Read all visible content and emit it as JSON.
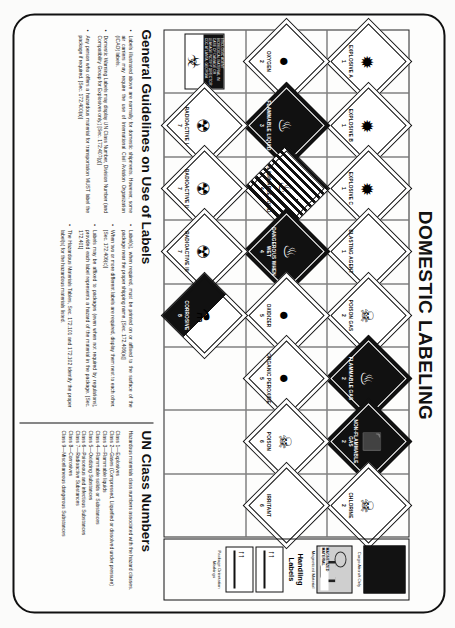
{
  "document": {
    "title": "DOMESTIC LABELING"
  },
  "label_grid": {
    "columns": [
      {
        "cells": [
          {
            "name": "EXPLOSIVE A",
            "symbol": "✹",
            "style": "empty",
            "number": "1"
          },
          {
            "name": "OXYGEN",
            "symbol": "●",
            "style": "empty",
            "number": "2"
          },
          {
            "name": "ETIOLOGIC AGENT",
            "style": "etiologic",
            "symbol": "☣",
            "caption": "ETIOLOGIC AGENT  BIOMEDICAL MATERIAL  IN CASE OF DAMAGE OR LEAKAGE NOTIFY DIRECTOR CDC ATLANTA, GEORGIA"
          }
        ]
      },
      {
        "cells": [
          {
            "name": "EXPLOSIVE B",
            "symbol": "✹",
            "style": "empty",
            "number": "1"
          },
          {
            "name": "FLAMMABLE LIQUID",
            "symbol": "♨",
            "style": "solid",
            "number": "3"
          },
          {
            "name": "RADIOACTIVE I",
            "symbol": "☢",
            "style": "empty",
            "number": "7"
          }
        ]
      },
      {
        "cells": [
          {
            "name": "EXPLOSIVE C",
            "symbol": "✹",
            "style": "empty",
            "number": "1"
          },
          {
            "name": "FLAMMABLE SOLID",
            "symbol": "♨",
            "style": "stripe",
            "number": "4"
          },
          {
            "name": "RADIOACTIVE II",
            "symbol": "☢",
            "style": "empty",
            "number": "7"
          }
        ]
      },
      {
        "cells": [
          {
            "name": "BLASTING AGENT",
            "symbol": "",
            "style": "empty",
            "number": "1"
          },
          {
            "name": "DANGEROUS WHEN WET",
            "symbol": "♨",
            "style": "solid",
            "number": "4"
          },
          {
            "name": "RADIOACTIVE III",
            "symbol": "☢",
            "style": "empty",
            "number": "7"
          }
        ]
      },
      {
        "cells": [
          {
            "name": "POISON GAS",
            "symbol": "☠",
            "style": "empty",
            "number": "2"
          },
          {
            "name": "OXIDIZER",
            "symbol": "●",
            "style": "empty",
            "number": "5"
          },
          {
            "name": "CORROSIVE",
            "symbol": "⚗",
            "style": "halfw",
            "number": "8"
          }
        ]
      },
      {
        "cells": [
          {
            "name": "FLAMMABLE GAS",
            "symbol": "♨",
            "style": "solid",
            "number": "2"
          },
          {
            "name": "ORGANIC PEROXIDE",
            "symbol": "●",
            "style": "empty",
            "number": "5"
          },
          {
            "name": "",
            "style": "blank",
            "symbol": "",
            "number": ""
          }
        ]
      },
      {
        "cells": [
          {
            "name": "NON-FLAMMABLE GAS",
            "symbol": "⬛",
            "style": "solid",
            "number": "2"
          },
          {
            "name": "POISON",
            "symbol": "☠",
            "style": "empty",
            "number": "6"
          },
          {
            "name": "",
            "style": "blank",
            "symbol": "",
            "number": ""
          }
        ]
      },
      {
        "cells": [
          {
            "name": "CHLORINE",
            "symbol": "☠",
            "style": "empty",
            "number": "2"
          },
          {
            "name": "IRRITANT",
            "symbol": "",
            "style": "empty",
            "number": "6"
          },
          {
            "name": "",
            "style": "blank",
            "symbol": "",
            "number": ""
          }
        ]
      }
    ]
  },
  "handling": {
    "title": "Handling Labels",
    "cargo_caption": "Cargo Aircraft Only",
    "magnetized_caption": "Magnetized Material",
    "magnetized_text": "MAGNETIZED MATERIAL",
    "orientation_caption": "Package Orientation Markings"
  },
  "guidelines": {
    "title": "General Guidelines on Use of Labels",
    "left_bullets": [
      "Labels illustrated above are normally for domestic shipments. However, some air carriers may require the use of International Civil Aviation Organization (ICAO) labels.",
      "Domestic Warning Labels may display UN Class Number, Division Number (and Compatibility Group for Explosives only.) [Sec. 172.407(g)]",
      "Any person who offers a hazardous material for transportation MUST label the package if required. [Sec. 172.400(a)]"
    ],
    "right_bullets": [
      "Label(s), when required, must be printed on or affixed to the surface of the package near the proper shipping name. [Sec. 172.406(a)]",
      "When two or more different labels are required, display them next to each other. [Sec. 172.406(c)]",
      "Labels may be affixed to packages (even when not required by regulations), provided each label represents a hazard of the material in the package. [Sec. 172.401]",
      "The Hazardous Materials Tables, Sec. 172.101 and 172.102 identify the proper label(s) for the hazardous materials listed."
    ]
  },
  "un_classes": {
    "title": "UN Class Numbers",
    "intro": "Hazardous materials class numbers associated with the hazard classes.",
    "items": [
      "Class 1—Explosives",
      "Class 2—Gases (Compressed, Liquefied or dissolved under pressure)",
      "Class 3—Flammable liquids",
      "Class 4—Flammable solids or Substances",
      "Class 5—Oxidizing Substances",
      "Class 6—Poisonous and infectious Substances",
      "Class 7—Radioactive Substances",
      "Class 8—Corrosives",
      "Class 9—Miscellaneous dangerous Substances"
    ],
    "class2_cont": "solved under pressure)"
  }
}
